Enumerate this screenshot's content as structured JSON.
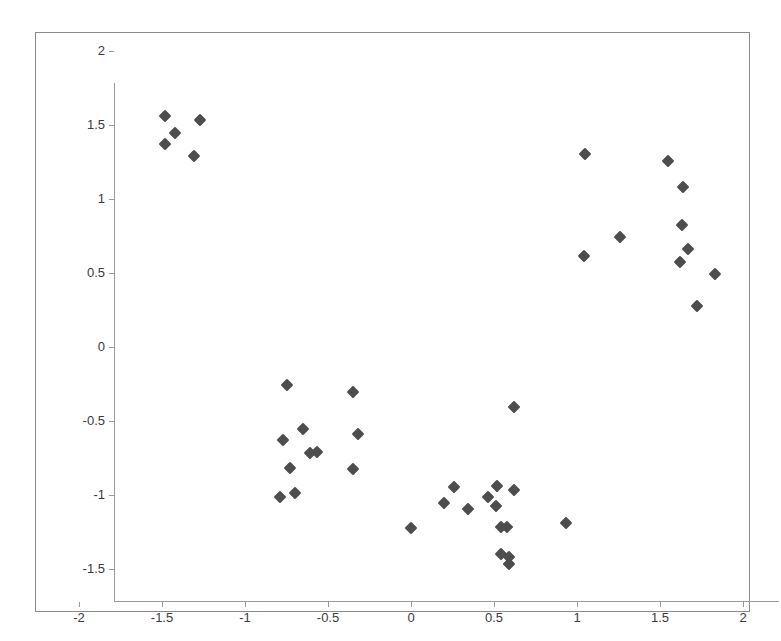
{
  "chart_data": {
    "type": "scatter",
    "title": "",
    "subtitle": "",
    "xlabel": "",
    "ylabel": "",
    "xlim": [
      -2,
      2
    ],
    "ylim": [
      -1.5,
      2
    ],
    "grid": false,
    "legend": null,
    "marker_shape": "diamond",
    "marker_color": "#4d4d4d",
    "background_color": "#ffffff",
    "border_color": "#8a8a8a",
    "axis_color": "#9a9a9a",
    "xticks": [
      -2,
      -1.5,
      -1,
      -0.5,
      0,
      0.5,
      1,
      1.5,
      2
    ],
    "xtick_labels": [
      "-2",
      "-1.5",
      "-1",
      "-0.5",
      "0",
      "0.5",
      "1",
      "1.5",
      "2"
    ],
    "yticks": [
      2,
      1.5,
      1,
      0.5,
      0,
      -0.5,
      -1,
      -1.5
    ],
    "ytick_labels": [
      "2",
      "1.5",
      "1",
      "0.5",
      "0",
      "-0.5",
      "-1",
      "-1.5"
    ],
    "series": [
      {
        "name": "points",
        "points": [
          [
            -1.69,
            1.78
          ],
          [
            -1.48,
            1.75
          ],
          [
            -1.63,
            1.66
          ],
          [
            -1.69,
            1.59
          ],
          [
            -1.52,
            1.51
          ],
          [
            0.84,
            1.52
          ],
          [
            1.34,
            1.47
          ],
          [
            1.43,
            1.3
          ],
          [
            1.05,
            0.96
          ],
          [
            1.42,
            1.04
          ],
          [
            1.46,
            0.88
          ],
          [
            0.83,
            0.83
          ],
          [
            1.41,
            0.79
          ],
          [
            1.62,
            0.71
          ],
          [
            1.51,
            0.49
          ],
          [
            -0.96,
            -0.04
          ],
          [
            -0.56,
            -0.09
          ],
          [
            -0.86,
            -0.34
          ],
          [
            -0.98,
            -0.41
          ],
          [
            -0.53,
            -0.37
          ],
          [
            -0.82,
            -0.5
          ],
          [
            -0.78,
            -0.49
          ],
          [
            -0.94,
            -0.6
          ],
          [
            -0.56,
            -0.61
          ],
          [
            -1.0,
            -0.8
          ],
          [
            -0.91,
            -0.77
          ],
          [
            0.41,
            -0.19
          ],
          [
            -0.21,
            -1.01
          ],
          [
            0.05,
            -0.73
          ],
          [
            0.31,
            -0.72
          ],
          [
            -0.01,
            -0.84
          ],
          [
            0.13,
            -0.88
          ],
          [
            0.25,
            -0.8
          ],
          [
            0.41,
            -0.75
          ],
          [
            0.33,
            -1.0
          ],
          [
            0.37,
            -1.0
          ],
          [
            0.3,
            -0.86
          ],
          [
            0.72,
            -0.97
          ],
          [
            0.33,
            -1.18
          ],
          [
            0.38,
            -1.2
          ],
          [
            0.38,
            -1.25
          ]
        ]
      }
    ]
  }
}
